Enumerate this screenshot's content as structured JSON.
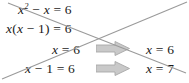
{
  "figure": {
    "type": "math-worksheet-snippet",
    "background_color": "#ffffff",
    "text_color": "#1a1a1a",
    "strike_line_color": "#9a9a9a",
    "arrow_fill_color": "#c9c9c9",
    "arrow_stroke_color": "#a8a8a8"
  },
  "equations": {
    "row1": {
      "lhs_base": "x",
      "lhs_exponent": "2",
      "operator": "−",
      "lhs_term2": "x",
      "equals": "=",
      "rhs": "6",
      "plain": "x² − x = 6"
    },
    "row2": {
      "plain": "x(x − 1) = 6",
      "lhs_factor": "x",
      "open_paren": "(",
      "inner_term1": "x",
      "operator": "−",
      "inner_term2": "1",
      "close_paren": ")",
      "equals": "=",
      "rhs": "6"
    },
    "row3": {
      "plain": "x = 6",
      "lhs": "x",
      "equals": "=",
      "rhs": "6"
    },
    "row4": {
      "plain": "x − 1 = 6",
      "lhs": "x",
      "operator": "−",
      "term2": "1",
      "equals": "=",
      "rhs": "6"
    }
  },
  "results": {
    "top": {
      "plain": "x = 6",
      "lhs": "x",
      "equals": "=",
      "rhs": "6"
    },
    "bottom": {
      "plain": "x = 7",
      "lhs": "x",
      "equals": "=",
      "rhs": "7"
    }
  },
  "arrows": [
    {
      "name": "arrow-top",
      "direction": "right",
      "label": "implies"
    },
    {
      "name": "arrow-bottom",
      "direction": "right",
      "label": "implies"
    }
  ],
  "strike_lines": [
    {
      "name": "strike-descending",
      "x1": 8,
      "y1": 3,
      "x2": 186,
      "y2": 73
    },
    {
      "name": "strike-ascending",
      "x1": 2,
      "y1": 79,
      "x2": 187,
      "y2": 2
    }
  ]
}
